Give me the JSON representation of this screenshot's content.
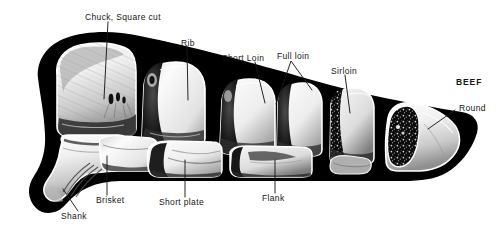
{
  "figure": {
    "name": "beef-carcass-cuts-diagram",
    "title": "BEEF",
    "background_color": "#ffffff",
    "silhouette_color": "#000000",
    "cut_fill_light": "#f2f2f2",
    "cut_fill_mid": "#b9b9b9",
    "cut_fill_dark": "#1a1a1a",
    "leader_line_color": "#1a1a1a"
  },
  "labels": {
    "title": {
      "text": "BEEF",
      "x": 456,
      "y": 82
    },
    "chuck": {
      "text": "Chuck, Square cut",
      "x": 85,
      "y": 13
    },
    "rib": {
      "text": "Rib",
      "x": 181,
      "y": 39
    },
    "short_loin": {
      "text": "Short Loin",
      "x": 222,
      "y": 55
    },
    "full_loin": {
      "text": "Full loin",
      "x": 277,
      "y": 53
    },
    "sirloin": {
      "text": "Sirloin",
      "x": 331,
      "y": 68
    },
    "round": {
      "text": "Round",
      "x": 459,
      "y": 108
    },
    "shank": {
      "text": "Shank",
      "x": 61,
      "y": 216
    },
    "brisket": {
      "text": "Brisket",
      "x": 96,
      "y": 200
    },
    "short_plate": {
      "text": "Short plate",
      "x": 159,
      "y": 202
    },
    "flank": {
      "text": "Flank",
      "x": 262,
      "y": 198
    }
  },
  "cuts": [
    {
      "name": "chuck-square-cut",
      "label": "Chuck, Square cut"
    },
    {
      "name": "rib",
      "label": "Rib"
    },
    {
      "name": "short-loin",
      "label": "Short Loin"
    },
    {
      "name": "full-loin",
      "label": "Full loin"
    },
    {
      "name": "sirloin",
      "label": "Sirloin"
    },
    {
      "name": "round",
      "label": "Round"
    },
    {
      "name": "shank",
      "label": "Shank"
    },
    {
      "name": "brisket",
      "label": "Brisket"
    },
    {
      "name": "short-plate",
      "label": "Short plate"
    },
    {
      "name": "flank",
      "label": "Flank"
    }
  ]
}
